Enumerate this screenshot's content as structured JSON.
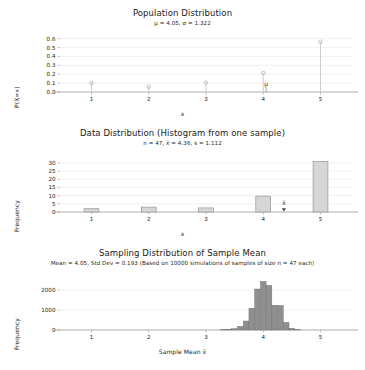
{
  "figure": {
    "background": "#ffffff",
    "width": 365,
    "height": 370
  },
  "panels": {
    "population": {
      "title": "Population Distribution",
      "subtitle": "μ = 4.05, σ = 1.322",
      "xlabel": "x",
      "ylabel": "P(X=x)",
      "mu_annotation": "μ"
    },
    "sample": {
      "title": "Data Distribution (Histogram from one sample)",
      "subtitle": "n = 47, x̄ = 4.36, s = 1.112",
      "xlabel": "x",
      "ylabel": "Frequency",
      "xbar_annotation": "x̄"
    },
    "sampling": {
      "title": "Sampling Distribution of Sample Mean",
      "subtitle": "Mean = 4.05, Std Dev = 0.193 (Based on 10000 simulations of samples of size n = 47 each)",
      "xlabel": "Sample Mean x̄",
      "ylabel": "Frequency"
    }
  },
  "chart_data": [
    {
      "type": "scatter",
      "name": "population-distribution",
      "title": "Population Distribution",
      "subtitle": "μ = 4.05, σ = 1.322",
      "xlabel": "x",
      "ylabel": "P(X=x)",
      "style": "stem",
      "x": [
        1,
        2,
        3,
        4,
        5
      ],
      "values": [
        0.1,
        0.06,
        0.105,
        0.215,
        0.565
      ],
      "xlim": [
        0.45,
        5.55
      ],
      "ylim": [
        0.0,
        0.63
      ],
      "xticks": [
        1,
        2,
        3,
        4,
        5
      ],
      "xtick_labels": [
        "1",
        "2",
        "3",
        "4",
        "5"
      ],
      "yticks": [
        0.0,
        0.1,
        0.2,
        0.3,
        0.4,
        0.5,
        0.6
      ],
      "ytick_labels": [
        "0.0",
        "0.1",
        "0.2",
        "0.3",
        "0.4",
        "0.5",
        "0.6"
      ],
      "grid": true,
      "legend": "none",
      "annotations": [
        {
          "label": "μ",
          "x": 4.05,
          "y": 0.045
        }
      ],
      "colors": {
        "marker": "#b0b0b0",
        "stem": "#c0c0c0",
        "grid": "#e8e8e8",
        "axis": "#999999"
      }
    },
    {
      "type": "bar",
      "name": "data-distribution-histogram",
      "title": "Data Distribution (Histogram from one sample)",
      "subtitle": "n = 47, x̄ = 4.36, s = 1.112",
      "xlabel": "x",
      "ylabel": "Frequency",
      "categories": [
        "1",
        "2",
        "3",
        "4",
        "5"
      ],
      "x": [
        1,
        2,
        3,
        4,
        5
      ],
      "values": [
        2,
        3,
        2.5,
        9.7,
        31
      ],
      "xlim": [
        0.45,
        5.55
      ],
      "ylim": [
        0,
        33
      ],
      "xticks": [
        1,
        2,
        3,
        4,
        5
      ],
      "xtick_labels": [
        "1",
        "2",
        "3",
        "4",
        "5"
      ],
      "yticks": [
        0,
        5,
        10,
        15,
        20,
        25,
        30
      ],
      "ytick_labels": [
        "0",
        "5",
        "10",
        "15",
        "20",
        "25",
        "30"
      ],
      "grid": true,
      "legend": "none",
      "bar_width": 0.26,
      "annotations": [
        {
          "label": "x̄",
          "x": 4.36,
          "y": 2.6,
          "marker": "triangle"
        }
      ],
      "colors": {
        "bar_fill": "#d6d6d6",
        "bar_edge": "#8a8a8a",
        "grid": "#e8e8e8",
        "axis": "#999999",
        "marker": "#4a4a4a"
      }
    },
    {
      "type": "bar",
      "name": "sampling-distribution-sample-mean",
      "title": "Sampling Distribution of Sample Mean",
      "subtitle": "Mean = 4.05, Std Dev = 0.193 (Based on 10000 simulations of samples of size n = 47 each)",
      "xlabel": "Sample Mean x̄",
      "ylabel": "Frequency",
      "x": [
        3.3,
        3.4,
        3.5,
        3.6,
        3.7,
        3.8,
        3.9,
        4.0,
        4.1,
        4.2,
        4.3,
        4.4,
        4.5,
        4.6
      ],
      "values": [
        20,
        40,
        70,
        180,
        450,
        1090,
        2050,
        2430,
        2230,
        1240,
        1230,
        380,
        90,
        25
      ],
      "xlim": [
        0.45,
        5.55
      ],
      "ylim": [
        0,
        2600
      ],
      "xticks": [
        1,
        2,
        3,
        4,
        5
      ],
      "xtick_labels": [
        "1",
        "2",
        "3",
        "4",
        "5"
      ],
      "yticks": [
        0,
        1000,
        2000
      ],
      "ytick_labels": [
        "0",
        "1000",
        "2000"
      ],
      "grid": true,
      "legend": "none",
      "bar_width": 0.1,
      "colors": {
        "bar_fill": "#8f8f8f",
        "bar_edge": "#6e6e6e",
        "grid": "#ececec",
        "axis": "#999999"
      }
    }
  ]
}
